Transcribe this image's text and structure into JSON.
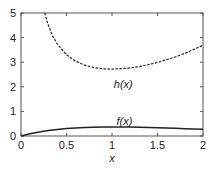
{
  "chart_data": {
    "type": "line",
    "title": "",
    "xlabel": "x",
    "ylabel": "",
    "xlim": [
      0,
      2
    ],
    "ylim": [
      0,
      5
    ],
    "xticks": [
      0,
      0.5,
      1,
      1.5,
      2
    ],
    "xtick_labels": [
      "0",
      "0.5",
      "1",
      "1.5",
      "2"
    ],
    "yticks": [
      0,
      1,
      2,
      3,
      4,
      5
    ],
    "ytick_labels": [
      "0",
      "1",
      "2",
      "3",
      "4",
      "5"
    ],
    "grid": false,
    "series": [
      {
        "name": "f(x)",
        "label": "f(x)",
        "style": "solid",
        "color": "#222222",
        "x": [
          0,
          0.1,
          0.2,
          0.3,
          0.4,
          0.5,
          0.6,
          0.7,
          0.8,
          0.9,
          1.0,
          1.1,
          1.2,
          1.3,
          1.4,
          1.5,
          1.6,
          1.7,
          1.8,
          1.9,
          2.0
        ],
        "y": [
          0,
          0.09,
          0.164,
          0.222,
          0.268,
          0.303,
          0.329,
          0.348,
          0.359,
          0.366,
          0.368,
          0.366,
          0.361,
          0.354,
          0.345,
          0.335,
          0.323,
          0.311,
          0.298,
          0.284,
          0.271
        ],
        "label_at": [
          1.05,
          0.45
        ]
      },
      {
        "name": "h(x)",
        "label": "h(x)",
        "style": "dashed",
        "color": "#222222",
        "x": [
          0.25,
          0.3,
          0.35,
          0.4,
          0.5,
          0.6,
          0.7,
          0.8,
          0.9,
          1.0,
          1.1,
          1.2,
          1.3,
          1.4,
          1.5,
          1.6,
          1.7,
          1.8,
          1.9,
          2.0
        ],
        "y": [
          5.14,
          4.5,
          4.05,
          3.73,
          3.3,
          3.04,
          2.88,
          2.78,
          2.73,
          2.72,
          2.74,
          2.77,
          2.82,
          2.9,
          2.99,
          3.1,
          3.22,
          3.36,
          3.52,
          3.69
        ],
        "label_at": [
          1.02,
          1.95
        ]
      }
    ]
  }
}
